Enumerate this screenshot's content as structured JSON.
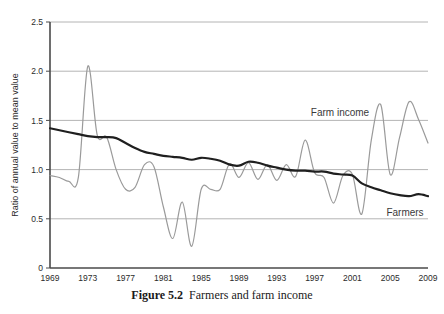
{
  "caption": {
    "number": "Figure 5.2",
    "text": "Farmers and farm income"
  },
  "chart_data": {
    "type": "line",
    "title": "",
    "xlabel": "",
    "ylabel": "Ratio of annual value to mean value",
    "xlim": [
      1969,
      2009
    ],
    "ylim": [
      0,
      2.5
    ],
    "grid": true,
    "legend_position": "inline-annotation",
    "ytick_labels": [
      "0",
      "0.5",
      "1.0",
      "1.5",
      "2.0",
      "2.5"
    ],
    "ytick_values": [
      0,
      0.5,
      1.0,
      1.5,
      2.0,
      2.5
    ],
    "xtick_labels": [
      "1969",
      "1973",
      "1977",
      "1981",
      "1985",
      "1989",
      "1993",
      "1997",
      "2001",
      "2005",
      "2009"
    ],
    "xtick_values": [
      1969,
      1973,
      1977,
      1981,
      1985,
      1989,
      1993,
      1997,
      2001,
      2005,
      2009
    ],
    "x": [
      1969,
      1970,
      1971,
      1972,
      1973,
      1974,
      1975,
      1976,
      1977,
      1978,
      1979,
      1980,
      1981,
      1982,
      1983,
      1984,
      1985,
      1986,
      1987,
      1988,
      1989,
      1990,
      1991,
      1992,
      1993,
      1994,
      1995,
      1996,
      1997,
      1998,
      1999,
      2000,
      2001,
      2002,
      2003,
      2004,
      2005,
      2006,
      2007,
      2008,
      2009
    ],
    "series": [
      {
        "name": "Farm income",
        "color": "#9a9a9a",
        "annotation": "Farm income",
        "values": [
          0.94,
          0.92,
          0.88,
          0.92,
          2.05,
          1.35,
          1.33,
          1.0,
          0.8,
          0.82,
          1.05,
          1.03,
          0.62,
          0.3,
          0.67,
          0.22,
          0.8,
          0.8,
          0.8,
          1.06,
          0.92,
          1.07,
          0.9,
          1.05,
          0.89,
          1.05,
          0.93,
          1.3,
          0.97,
          0.92,
          0.66,
          0.94,
          0.95,
          0.55,
          1.3,
          1.66,
          0.95,
          1.33,
          1.69,
          1.51,
          1.27
        ]
      },
      {
        "name": "Farmers",
        "color": "#1f1f1f",
        "annotation": "Farmers",
        "values": [
          1.42,
          1.4,
          1.38,
          1.36,
          1.34,
          1.33,
          1.33,
          1.32,
          1.27,
          1.22,
          1.18,
          1.16,
          1.14,
          1.13,
          1.12,
          1.1,
          1.12,
          1.11,
          1.09,
          1.05,
          1.04,
          1.08,
          1.07,
          1.04,
          1.02,
          1.0,
          0.99,
          0.99,
          0.98,
          0.98,
          0.96,
          0.95,
          0.94,
          0.86,
          0.82,
          0.79,
          0.76,
          0.74,
          0.73,
          0.75,
          0.73
        ]
      }
    ]
  }
}
